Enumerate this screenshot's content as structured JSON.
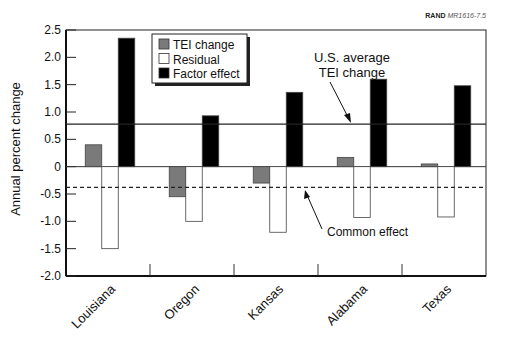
{
  "header": {
    "tag_bold": "RAND",
    "tag_italic": "MR1616-7.5"
  },
  "chart_data": {
    "type": "bar",
    "title": "",
    "xlabel": "",
    "ylabel": "Annual percent change",
    "ylim": [
      -2.0,
      2.5
    ],
    "yticks": [
      "2.5",
      "2.0",
      "1.5",
      "1.0",
      "0.5",
      "0",
      "-0.5",
      "-1.0",
      "-1.5",
      "-2.0"
    ],
    "ytick_values": [
      2.5,
      2.0,
      1.5,
      1.0,
      0.5,
      0,
      -0.5,
      -1.0,
      -1.5,
      -2.0
    ],
    "grid": false,
    "legend_position": "upper-left-inside",
    "categories": [
      "Louisiana",
      "Oregon",
      "Kansas",
      "Alabama",
      "Texas"
    ],
    "series": [
      {
        "name": "TEI change",
        "color": "#7a7a7a",
        "values": [
          0.4,
          -0.55,
          -0.3,
          0.17,
          0.05
        ]
      },
      {
        "name": "Residual",
        "color": "#ffffff",
        "values": [
          -1.5,
          -1.0,
          -1.2,
          -0.93,
          -0.92
        ]
      },
      {
        "name": "Factor effect",
        "color": "#000000",
        "values": [
          2.35,
          0.93,
          1.36,
          1.6,
          1.48
        ]
      }
    ],
    "reference_lines": [
      {
        "name": "U.S. average TEI change",
        "value": 0.78,
        "style": "solid"
      },
      {
        "name": "Common effect",
        "value": -0.38,
        "style": "dashed"
      }
    ],
    "annotations": [
      {
        "text_line1": "U.S. average",
        "text_line2": "TEI change"
      },
      {
        "text": "Common effect"
      }
    ]
  }
}
